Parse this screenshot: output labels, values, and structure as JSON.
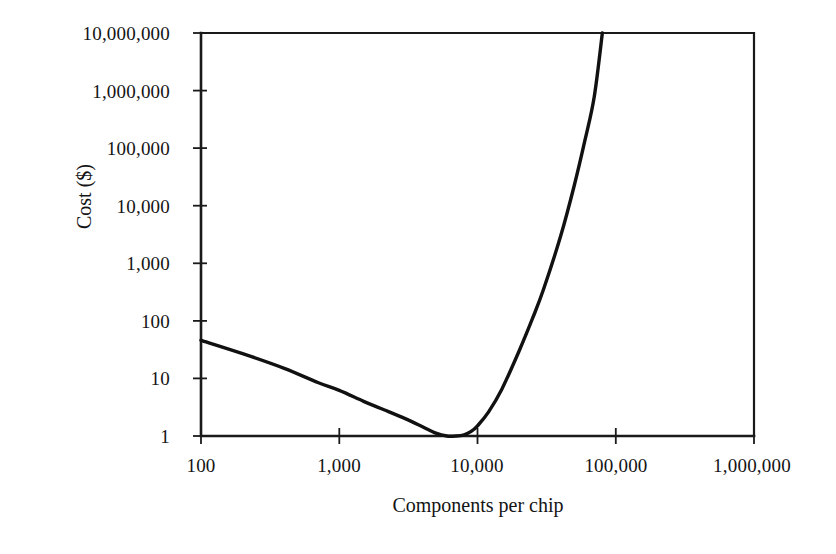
{
  "chart_data": {
    "type": "line",
    "title": "",
    "xlabel": "Components per chip",
    "ylabel": "Cost ($)",
    "xscale": "log",
    "yscale": "log",
    "xlim": [
      100,
      1000000
    ],
    "ylim": [
      1,
      10000000
    ],
    "grid": false,
    "legend": null,
    "x_tick_labels": [
      "100",
      "1,000",
      "10,000",
      "100,000",
      "1,000,000"
    ],
    "x_tick_values": [
      100,
      1000,
      10000,
      100000,
      1000000
    ],
    "y_tick_labels": [
      "1",
      "10",
      "100",
      "1,000",
      "10,000",
      "100,000",
      "1,000,000",
      "10,000,000"
    ],
    "y_tick_values": [
      1,
      10,
      100,
      1000,
      10000,
      100000,
      1000000,
      10000000
    ],
    "series": [
      {
        "name": "Cost per component",
        "x": [
          100,
          200,
          400,
          700,
          1000,
          1500,
          2000,
          3000,
          4000,
          5000,
          6000,
          7000,
          8000,
          9000,
          10000,
          12000,
          15000,
          20000,
          25000,
          30000,
          40000,
          50000,
          60000,
          70000,
          80000
        ],
        "y": [
          46,
          27,
          15,
          8.5,
          6.2,
          4.0,
          3.0,
          2.0,
          1.45,
          1.12,
          1.0,
          1.0,
          1.05,
          1.2,
          1.5,
          2.6,
          6.5,
          30,
          110,
          350,
          3000,
          22000,
          140000,
          800000,
          10000000
        ]
      }
    ],
    "annotations": []
  },
  "axis": {
    "y_title": "Cost ($)",
    "x_title": "Components per chip",
    "y_ticks": [
      {
        "label": "10,000,000",
        "value": 10000000
      },
      {
        "label": "1,000,000",
        "value": 1000000
      },
      {
        "label": "100,000",
        "value": 100000
      },
      {
        "label": "10,000",
        "value": 10000
      },
      {
        "label": "1,000",
        "value": 1000
      },
      {
        "label": "100",
        "value": 100
      },
      {
        "label": "10",
        "value": 10
      },
      {
        "label": "1",
        "value": 1
      }
    ],
    "x_ticks": [
      {
        "label": "100",
        "value": 100
      },
      {
        "label": "1,000",
        "value": 1000
      },
      {
        "label": "10,000",
        "value": 10000
      },
      {
        "label": "100,000",
        "value": 100000
      },
      {
        "label": "1,000,000",
        "value": 1000000
      }
    ]
  },
  "style": {
    "curve_color": "#111111",
    "axis_color": "#1a1a1a",
    "background": "#ffffff"
  }
}
